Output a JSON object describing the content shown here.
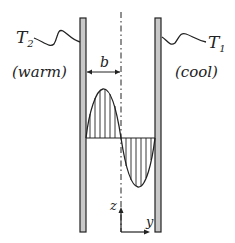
{
  "diagram": {
    "labels": {
      "t2": "T",
      "t2_sub": "2",
      "t1": "T",
      "t1_sub": "1",
      "warm": "(warm)",
      "cool": "(cool)",
      "b": "b",
      "z": "z",
      "y": "y"
    },
    "colors": {
      "wall_fill": "#c8c8c8",
      "stroke": "#222222"
    }
  }
}
